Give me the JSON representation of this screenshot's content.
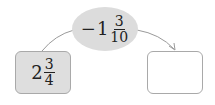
{
  "operator": {
    "sign": "−",
    "whole": "1",
    "numerator": "3",
    "denominator": "10"
  },
  "start_box": {
    "whole": "2",
    "numerator": "3",
    "denominator": "4"
  },
  "result_box": {
    "value": ""
  },
  "colors": {
    "ellipse_fill": "#dcdcdc",
    "start_box_fill": "#dedede",
    "border": "#a9a9a9",
    "arrow": "#999999"
  }
}
